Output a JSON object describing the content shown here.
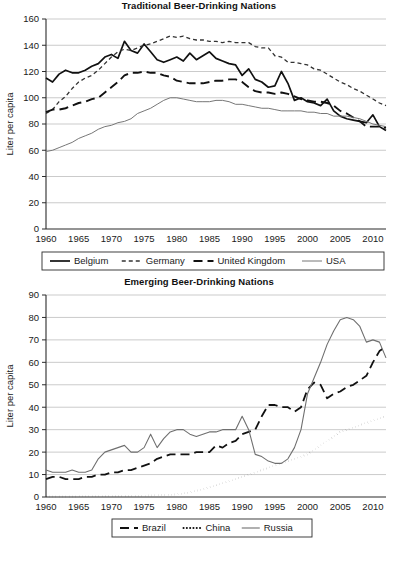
{
  "figure": {
    "background": "#ffffff",
    "ink": "#1a1a1a",
    "gridline_color": "#b4b4b4",
    "caption_partial": ""
  },
  "chart_data": [
    {
      "id": "traditional",
      "type": "line",
      "title": "Traditional Beer-Drinking Nations",
      "xlabel": "",
      "ylabel": "Liter per capita",
      "xlim": [
        1960,
        2012
      ],
      "ylim": [
        0,
        160
      ],
      "ytick_step": 20,
      "yticks": [
        0,
        20,
        40,
        60,
        80,
        100,
        120,
        140,
        160
      ],
      "xticks": [
        1960,
        1965,
        1970,
        1975,
        1980,
        1985,
        1990,
        1995,
        2000,
        2005,
        2010
      ],
      "grid": true,
      "legend_position": "below",
      "x": [
        1960,
        1961,
        1962,
        1963,
        1964,
        1965,
        1966,
        1967,
        1968,
        1969,
        1970,
        1971,
        1972,
        1973,
        1974,
        1975,
        1976,
        1977,
        1978,
        1979,
        1980,
        1981,
        1982,
        1983,
        1984,
        1985,
        1986,
        1987,
        1988,
        1989,
        1990,
        1991,
        1992,
        1993,
        1994,
        1995,
        1996,
        1997,
        1998,
        1999,
        2000,
        2001,
        2002,
        2003,
        2004,
        2005,
        2006,
        2007,
        2008,
        2009,
        2010,
        2011,
        2012
      ],
      "series": [
        {
          "name": "Belgium",
          "style": "solid-thick",
          "color": "#111111",
          "width": 1.7,
          "dash": "",
          "values": [
            115,
            112,
            118,
            121,
            119,
            119,
            121,
            124,
            126,
            131,
            133,
            130,
            143,
            136,
            134,
            141,
            135,
            129,
            127,
            129,
            131,
            128,
            134,
            129,
            132,
            135,
            130,
            128,
            126,
            125,
            117,
            122,
            114,
            112,
            108,
            109,
            120,
            111,
            98,
            100,
            97,
            96,
            94,
            99,
            90,
            86,
            84,
            83,
            82,
            81,
            87,
            78,
            75
          ]
        },
        {
          "name": "Germany",
          "style": "dashed-short",
          "color": "#333333",
          "width": 1.3,
          "dash": "4,3",
          "values": [
            88,
            91,
            97,
            101,
            107,
            112,
            115,
            117,
            121,
            126,
            131,
            135,
            137,
            136,
            138,
            140,
            141,
            143,
            145,
            147,
            146,
            147,
            145,
            144,
            144,
            143,
            143,
            142,
            143,
            142,
            142,
            142,
            139,
            138,
            138,
            132,
            131,
            127,
            127,
            126,
            125,
            122,
            121,
            118,
            115,
            112,
            110,
            107,
            105,
            102,
            99,
            96,
            94
          ]
        },
        {
          "name": "United Kingdom",
          "style": "dashed-long",
          "color": "#111111",
          "width": 1.9,
          "dash": "9,5",
          "values": [
            89,
            91,
            91,
            92,
            94,
            96,
            97,
            99,
            100,
            104,
            108,
            112,
            117,
            119,
            119,
            120,
            119,
            119,
            117,
            116,
            113,
            112,
            111,
            111,
            111,
            112,
            113,
            113,
            114,
            114,
            112,
            108,
            105,
            104,
            104,
            103,
            104,
            103,
            101,
            99,
            98,
            97,
            97,
            96,
            94,
            90,
            88,
            85,
            82,
            78,
            78,
            78,
            77
          ]
        },
        {
          "name": "USA",
          "style": "solid-thin",
          "color": "#777777",
          "width": 1.0,
          "dash": "",
          "values": [
            59,
            60,
            62,
            64,
            66,
            69,
            71,
            73,
            76,
            78,
            79,
            81,
            82,
            84,
            88,
            90,
            92,
            95,
            98,
            100,
            100,
            99,
            98,
            97,
            97,
            97,
            98,
            98,
            97,
            95,
            95,
            94,
            93,
            92,
            92,
            91,
            90,
            90,
            90,
            90,
            89,
            89,
            88,
            88,
            86,
            86,
            86,
            85,
            84,
            82,
            80,
            79,
            78
          ]
        }
      ]
    },
    {
      "id": "emerging",
      "type": "line",
      "title": "Emerging Beer-Drinking Nations",
      "xlabel": "",
      "ylabel": "Liter per capita",
      "xlim": [
        1960,
        2012
      ],
      "ylim": [
        0,
        90
      ],
      "ytick_step": 10,
      "yticks": [
        0,
        10,
        20,
        30,
        40,
        50,
        60,
        70,
        80,
        90
      ],
      "xticks": [
        1960,
        1965,
        1970,
        1975,
        1980,
        1985,
        1990,
        1995,
        2000,
        2005,
        2010
      ],
      "grid": true,
      "legend_position": "below",
      "x": [
        1960,
        1961,
        1962,
        1963,
        1964,
        1965,
        1966,
        1967,
        1968,
        1969,
        1970,
        1971,
        1972,
        1973,
        1974,
        1975,
        1976,
        1977,
        1978,
        1979,
        1980,
        1981,
        1982,
        1983,
        1984,
        1985,
        1986,
        1987,
        1988,
        1989,
        1990,
        1991,
        1992,
        1993,
        1994,
        1995,
        1996,
        1997,
        1998,
        1999,
        2000,
        2001,
        2002,
        2003,
        2004,
        2005,
        2006,
        2007,
        2008,
        2009,
        2010,
        2011,
        2012
      ],
      "series": [
        {
          "name": "Brazil",
          "style": "dashed-long",
          "color": "#111111",
          "width": 1.8,
          "dash": "9,5",
          "values": [
            8,
            9,
            9,
            8,
            8,
            8,
            9,
            9,
            10,
            10,
            11,
            11,
            12,
            12,
            13,
            14,
            15,
            17,
            18,
            19,
            19,
            19,
            19,
            20,
            20,
            20,
            23,
            22,
            24,
            25,
            28,
            29,
            30,
            36,
            41,
            41,
            40,
            40,
            38,
            40,
            48,
            51,
            50,
            44,
            46,
            47,
            49,
            50,
            52,
            54,
            60,
            65,
            67
          ]
        },
        {
          "name": "China",
          "style": "dotted",
          "color": "#111111",
          "width": 2.0,
          "dash": "0.1,3.2",
          "values": [
            0.2,
            0.2,
            0.2,
            0.2,
            0.2,
            0.3,
            0.3,
            0.3,
            0.3,
            0.4,
            0.4,
            0.4,
            0.5,
            0.5,
            0.6,
            0.6,
            0.7,
            0.8,
            0.9,
            1.0,
            1.2,
            1.6,
            2.1,
            2.8,
            3.5,
            4.3,
            5.2,
            6.1,
            7.0,
            8.0,
            9.0,
            10,
            11,
            12,
            13,
            14,
            15,
            16,
            17,
            18,
            19,
            21,
            23,
            25,
            27,
            29,
            30,
            31,
            32,
            33,
            34,
            35,
            36
          ]
        },
        {
          "name": "Russia",
          "style": "solid-thin",
          "color": "#6f6f6f",
          "width": 1.1,
          "dash": "",
          "values": [
            12,
            11,
            11,
            11,
            12,
            11,
            11,
            12,
            17,
            20,
            21,
            22,
            23,
            20,
            20,
            22,
            28,
            22,
            26,
            29,
            30,
            30,
            28,
            27,
            28,
            29,
            29,
            30,
            30,
            30,
            36,
            30,
            19,
            18,
            16,
            15,
            15,
            17,
            22,
            30,
            46,
            53,
            60,
            68,
            74,
            79,
            80,
            79,
            76,
            69,
            70,
            69,
            62
          ]
        }
      ]
    }
  ]
}
